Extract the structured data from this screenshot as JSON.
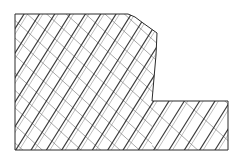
{
  "figure": {
    "title": "Hatched stepped cross-section",
    "background_color": "#ffffff",
    "outline_color": "#2b2b2b",
    "hatch_major_color": "#3a3a3a",
    "hatch_minor_color": "#6e6e6e",
    "hatch_pair_color": "#7a7a7a",
    "canvas": {
      "width": 241,
      "height": 161
    }
  },
  "chart_data": {
    "type": "diagram",
    "title": "Hatched stepped cross-section",
    "xlabel": "",
    "ylabel": "",
    "xlim": [
      0,
      241
    ],
    "ylim": [
      0,
      161
    ],
    "grid": false,
    "legend": false,
    "outline_points": [
      [
        15,
        14
      ],
      [
        128,
        14
      ],
      [
        135,
        17
      ],
      [
        143,
        23
      ],
      [
        150,
        28
      ],
      [
        157,
        33
      ],
      [
        156,
        55
      ],
      [
        154,
        78
      ],
      [
        152,
        101
      ],
      [
        228,
        101
      ],
      [
        228,
        150
      ],
      [
        15,
        150
      ]
    ],
    "regions": [
      {
        "name": "upper-body",
        "clip_points": [
          [
            15,
            14
          ],
          [
            128,
            14
          ],
          [
            135,
            17
          ],
          [
            143,
            23
          ],
          [
            150,
            28
          ],
          [
            157,
            33
          ],
          [
            156,
            55
          ],
          [
            154,
            78
          ],
          [
            152,
            101
          ],
          [
            152,
            150
          ],
          [
            15,
            150
          ]
        ],
        "hatch_density": "dense"
      },
      {
        "name": "lower-right-step",
        "clip_points": [
          [
            152,
            101
          ],
          [
            228,
            101
          ],
          [
            228,
            150
          ],
          [
            152,
            150
          ]
        ],
        "hatch_density": "sparse"
      }
    ],
    "hatch_families": [
      {
        "name": "major-descending-right",
        "angle_deg": -58,
        "spacing_px": 13,
        "weight": "thick",
        "color": "#3a3a3a"
      },
      {
        "name": "minor-descending-left",
        "angle_deg": 42,
        "spacing_px": 13,
        "weight": "thin",
        "color": "#6e6e6e"
      },
      {
        "name": "paired-offset",
        "angle_deg": -58,
        "spacing_px": 13,
        "offset_px": 3,
        "weight": "hairline",
        "color": "#7a7a7a"
      }
    ]
  }
}
